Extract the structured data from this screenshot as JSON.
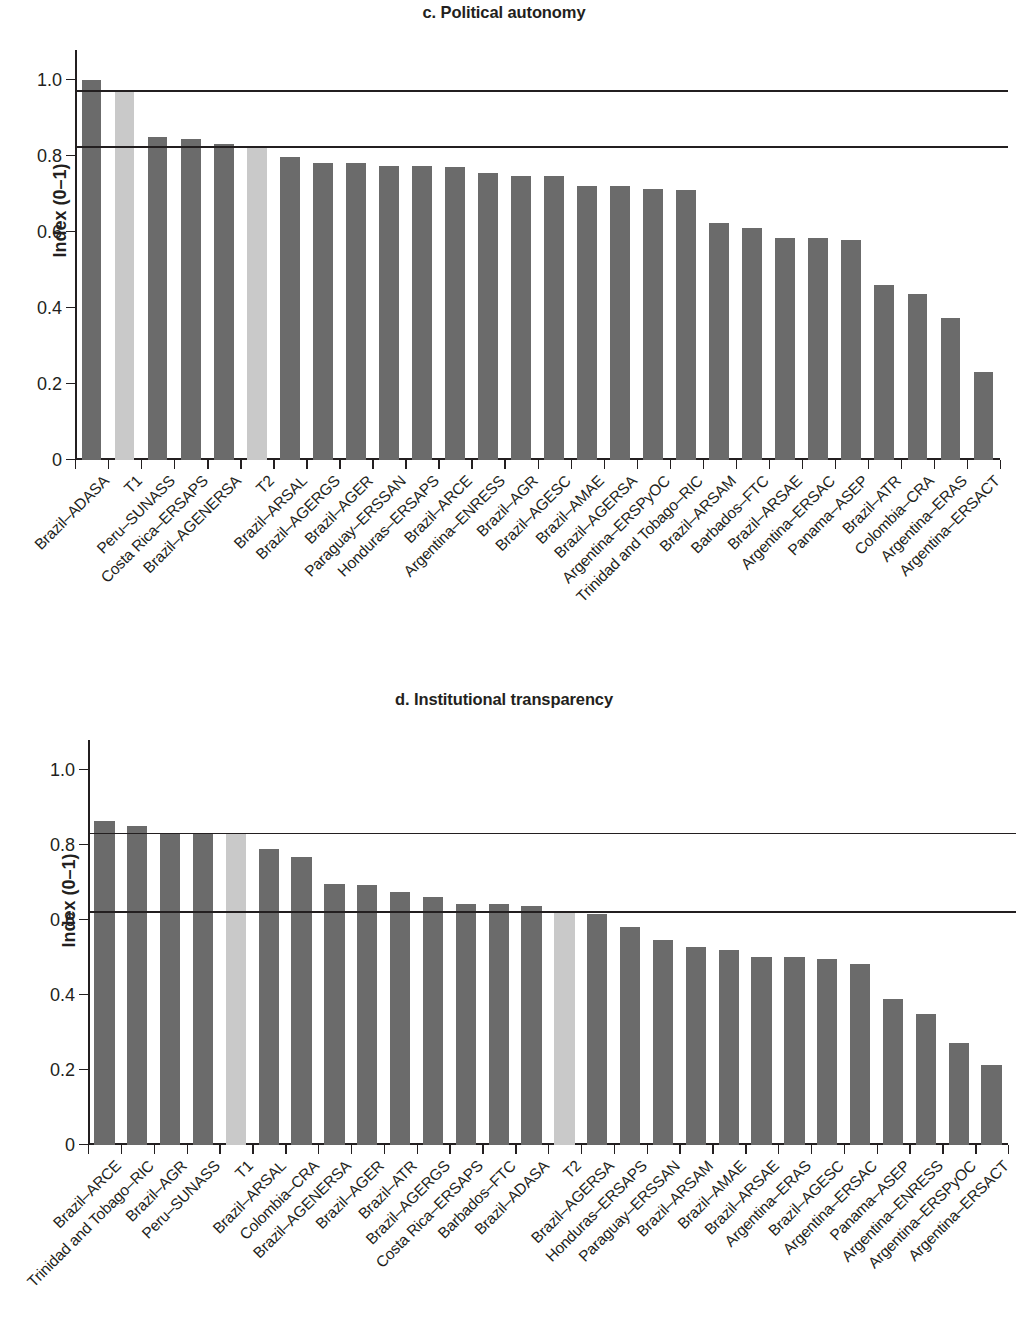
{
  "figure": {
    "panels": [
      {
        "id": "c",
        "title": "c. Political autonomy",
        "ylabel": "Index (0–1)"
      },
      {
        "id": "d",
        "title": "d. Institutional transparency",
        "ylabel": "Index (0–1)"
      }
    ],
    "colors": {
      "bar_dark": "#6b6b6b",
      "bar_light": "#c9c9c9",
      "axis": "#231f20",
      "background": "#ffffff"
    }
  },
  "chart_data": [
    {
      "type": "bar",
      "title": "c. Political autonomy",
      "xlabel": "",
      "ylabel": "Index (0–1)",
      "ylim": [
        0,
        1.08
      ],
      "yticks": [
        0,
        0.2,
        0.4,
        0.6,
        0.8,
        1.0
      ],
      "ytick_labels": [
        "0",
        "0.2",
        "0.4",
        "0.6",
        "0.8",
        "1.0"
      ],
      "grid": false,
      "legend": "none",
      "reference_lines": [
        {
          "name": "T1 reference",
          "value": 0.97
        },
        {
          "name": "T2 reference",
          "value": 0.823
        }
      ],
      "categories": [
        "Brazil–ADASA",
        "T1",
        "Peru–SUNASS",
        "Costa Rica–ERSAPS",
        "Brazil–AGENERSA",
        "T2",
        "Brazil–ARSAL",
        "Brazil–AGERGS",
        "Brazil–AGER",
        "Paraguay–ERSSAN",
        "Honduras–ERSAPS",
        "Brazil–ARCE",
        "Argentina–ENRESS",
        "Brazil–AGR",
        "Brazil–AGESC",
        "Brazil–AMAE",
        "Brazil–AGERSA",
        "Argentina–ERSPyOC",
        "Trinidad and Tobago–RIC",
        "Brazil–ARSAM",
        "Barbados–FTC",
        "Brazil–ARSAE",
        "Argentina–ERSAC",
        "Panama–ASEP",
        "Brazil–ATR",
        "Colombia–CRA",
        "Argentina–ERAS",
        "Argentina–ERSACT"
      ],
      "values": [
        1.0,
        0.97,
        0.852,
        0.845,
        0.833,
        0.823,
        0.798,
        0.783,
        0.783,
        0.775,
        0.774,
        0.773,
        0.757,
        0.748,
        0.748,
        0.722,
        0.722,
        0.713,
        0.711,
        0.625,
        0.612,
        0.586,
        0.585,
        0.579,
        0.462,
        0.438,
        0.374,
        0.231
      ],
      "highlighted_categories": [
        "T1",
        "T2"
      ]
    },
    {
      "type": "bar",
      "title": "d. Institutional transparency",
      "xlabel": "",
      "ylabel": "Index (0–1)",
      "ylim": [
        0,
        1.08
      ],
      "yticks": [
        0,
        0.2,
        0.4,
        0.6,
        0.8,
        1.0
      ],
      "ytick_labels": [
        "0",
        "0.2",
        "0.4",
        "0.6",
        "0.8",
        "1.0"
      ],
      "grid": false,
      "legend": "none",
      "reference_lines": [
        {
          "name": "T1 reference",
          "value": 0.829
        },
        {
          "name": "T2 reference",
          "value": 0.62
        }
      ],
      "categories": [
        "Brazil–ARCE",
        "Trinidad and Tobago–RIC",
        "Brazil–AGR",
        "Peru–SUNASS",
        "T1",
        "Brazil–ARSAL",
        "Colombia–CRA",
        "Brazil–AGENERSA",
        "Brazil–AGER",
        "Brazil–ATR",
        "Brazil–AGERGS",
        "Costa Rica–ERSAPS",
        "Barbados–FTC",
        "Brazil–ADASA",
        "T2",
        "Brazil–AGERSA",
        "Honduras–ERSAPS",
        "Paraguay–ERSSAN",
        "Brazil–ARSAM",
        "Brazil–AMAE",
        "Brazil–ARSAE",
        "Argentina–ERAS",
        "Brazil–AGESC",
        "Argentina–ERSAC",
        "Panama–ASEP",
        "Argentina–ENRESS",
        "Argentina–ERSPyOC",
        "Argentina–ERSACT"
      ],
      "values": [
        0.863,
        0.85,
        0.833,
        0.829,
        0.829,
        0.79,
        0.768,
        0.697,
        0.693,
        0.676,
        0.661,
        0.643,
        0.643,
        0.637,
        0.62,
        0.616,
        0.582,
        0.548,
        0.528,
        0.521,
        0.501,
        0.501,
        0.496,
        0.483,
        0.39,
        0.35,
        0.273,
        0.213
      ],
      "highlighted_categories": [
        "T1",
        "T2"
      ]
    }
  ]
}
